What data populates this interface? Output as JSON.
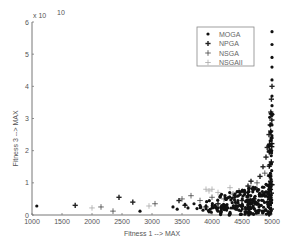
{
  "chart_data": {
    "type": "scatter",
    "title": "",
    "xlabel": "Fitness 1 --> MAX",
    "ylabel": "Fitness 3 --> MAX",
    "y_multiplier": "x 10",
    "y_exponent": "10",
    "xlim": [
      1000,
      5000
    ],
    "ylim": [
      0,
      6
    ],
    "xticks": [
      1000,
      1500,
      2000,
      2500,
      3000,
      3500,
      4000,
      4500,
      5000
    ],
    "yticks": [
      0,
      1,
      2,
      3,
      4,
      5,
      6
    ],
    "grid": false,
    "legend_position": "upper right",
    "legend": [
      "MOGA",
      "NPGA",
      "NSGA",
      "NSGAII"
    ],
    "series": [
      {
        "name": "MOGA",
        "marker": "dot",
        "color": "#111111",
        "points": [
          [
            1080,
            0.28
          ],
          [
            2800,
            0.12
          ],
          [
            3350,
            0.25
          ],
          [
            3420,
            0.18
          ],
          [
            3550,
            0.32
          ],
          [
            3600,
            0.22
          ],
          [
            3700,
            0.35
          ],
          [
            3750,
            0.2
          ],
          [
            3800,
            0.3
          ],
          [
            3850,
            0.15
          ],
          [
            3900,
            0.28
          ],
          [
            3950,
            0.1
          ],
          [
            4000,
            0.22
          ],
          [
            4050,
            0.3
          ],
          [
            4100,
            0.12
          ],
          [
            4150,
            0.25
          ],
          [
            4200,
            0.18
          ],
          [
            4250,
            0.32
          ],
          [
            4300,
            0.08
          ],
          [
            4350,
            0.22
          ],
          [
            4400,
            0.28
          ],
          [
            4450,
            0.15
          ],
          [
            4500,
            0.3
          ],
          [
            4550,
            0.1
          ],
          [
            4600,
            0.25
          ],
          [
            4650,
            0.35
          ],
          [
            4700,
            0.2
          ],
          [
            4750,
            0.12
          ],
          [
            4800,
            0.3
          ],
          [
            4850,
            0.45
          ],
          [
            4900,
            0.6
          ],
          [
            4950,
            0.9
          ],
          [
            4980,
            1.2
          ],
          [
            4990,
            1.6
          ],
          [
            4995,
            2.0
          ],
          [
            5000,
            2.4
          ],
          [
            5000,
            2.8
          ],
          [
            5000,
            3.1
          ],
          [
            5000,
            3.4
          ],
          [
            5000,
            3.7
          ],
          [
            5000,
            4.2
          ],
          [
            5000,
            4.6
          ],
          [
            5000,
            4.9
          ],
          [
            5000,
            5.3
          ],
          [
            5000,
            5.7
          ]
        ]
      },
      {
        "name": "NPGA",
        "marker": "plus-bold",
        "color": "#222222",
        "points": [
          [
            1720,
            0.3
          ],
          [
            2450,
            0.55
          ],
          [
            2680,
            0.4
          ],
          [
            3450,
            0.45
          ],
          [
            3550,
            0.3
          ],
          [
            3900,
            0.25
          ],
          [
            4100,
            0.35
          ],
          [
            4250,
            0.2
          ],
          [
            4400,
            0.3
          ],
          [
            4500,
            0.45
          ],
          [
            4550,
            0.7
          ],
          [
            4600,
            0.9
          ],
          [
            4650,
            1.05
          ],
          [
            4700,
            0.5
          ],
          [
            4750,
            0.8
          ],
          [
            4800,
            1.2
          ],
          [
            4850,
            1.5
          ],
          [
            4900,
            1.8
          ],
          [
            4920,
            2.1
          ],
          [
            4950,
            2.5
          ],
          [
            4970,
            2.8
          ],
          [
            4980,
            3.2
          ],
          [
            4990,
            3.6
          ],
          [
            5000,
            4.0
          ]
        ]
      },
      {
        "name": "NSGA",
        "marker": "plus",
        "color": "#444444",
        "points": [
          [
            2150,
            0.25
          ],
          [
            2350,
            0.12
          ],
          [
            3050,
            0.35
          ],
          [
            3500,
            0.5
          ],
          [
            3650,
            0.6
          ],
          [
            3800,
            0.45
          ],
          [
            4000,
            0.55
          ],
          [
            4200,
            0.5
          ],
          [
            4350,
            0.65
          ],
          [
            4450,
            0.75
          ],
          [
            4600,
            0.55
          ],
          [
            4750,
            1.0
          ],
          [
            4880,
            1.3
          ]
        ]
      },
      {
        "name": "NSGAII",
        "marker": "plus-light",
        "color": "#aaaaaa",
        "points": [
          [
            2000,
            0.22
          ],
          [
            2950,
            0.28
          ],
          [
            3900,
            0.8
          ],
          [
            3950,
            0.75
          ],
          [
            4000,
            0.8
          ],
          [
            4100,
            0.7
          ],
          [
            4300,
            0.85
          ],
          [
            4500,
            0.6
          ],
          [
            4650,
            0.9
          ],
          [
            4800,
            0.7
          ]
        ]
      }
    ]
  }
}
